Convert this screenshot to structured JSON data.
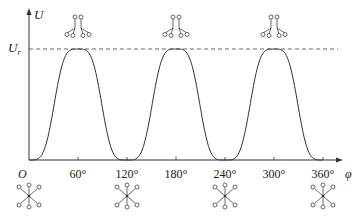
{
  "figure": {
    "type": "potential-energy-vs-torsion-angle",
    "y_axis_label": "U",
    "x_axis_label": "φ",
    "origin_label": "O",
    "barrier_label_main": "U",
    "barrier_label_sub": "r",
    "x_ticks": [
      "60°",
      "120°",
      "180°",
      "240°",
      "300°",
      "360°"
    ],
    "x_tick_values": [
      60,
      120,
      180,
      240,
      300,
      360
    ],
    "x_range": [
      0,
      375
    ],
    "y_range": [
      0,
      1.15
    ],
    "barrier_value": 1.0,
    "peaks_deg": [
      60,
      180,
      300
    ],
    "minima_deg": [
      0,
      120,
      240,
      360
    ],
    "top_conformation": "eclipsed",
    "bottom_conformation": "staggered"
  },
  "chart_data": {
    "type": "line",
    "title": "",
    "xlabel": "φ",
    "ylabel": "U",
    "xlim": [
      0,
      375
    ],
    "ylim": [
      0,
      1.15
    ],
    "x_tick_labels": [
      "60°",
      "120°",
      "180°",
      "240°",
      "300°",
      "360°"
    ],
    "reference_line": {
      "label": "U_r",
      "value": 1.0,
      "style": "dashed"
    },
    "series": [
      {
        "name": "U(φ)",
        "x": [
          0,
          15,
          30,
          45,
          60,
          75,
          90,
          105,
          120,
          135,
          150,
          165,
          180,
          195,
          210,
          225,
          240,
          255,
          270,
          285,
          300,
          315,
          330,
          345,
          360
        ],
        "values": [
          0,
          0.15,
          0.75,
          0.97,
          1.0,
          0.97,
          0.75,
          0.15,
          0,
          0.15,
          0.75,
          0.97,
          1.0,
          0.97,
          0.75,
          0.15,
          0,
          0.15,
          0.75,
          0.97,
          1.0,
          0.97,
          0.75,
          0.15,
          0
        ]
      }
    ],
    "grid": false,
    "legend": "none"
  }
}
